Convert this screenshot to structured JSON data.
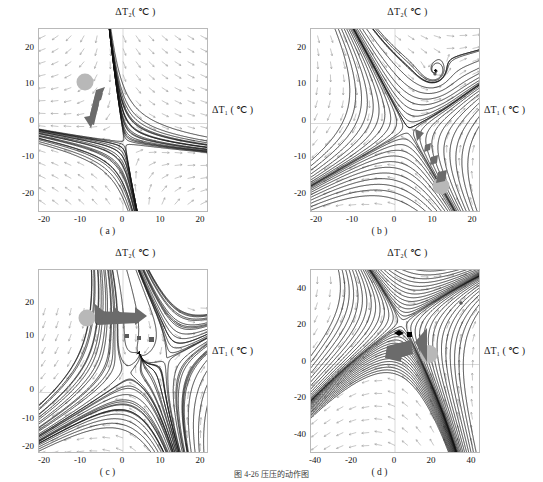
{
  "figure": {
    "caption": "图 4-26  压压的动作图",
    "axis_title_y": "ΔT₂( ℃ )",
    "axis_title_x": "ΔT₁ ( ℃ )"
  },
  "panels": [
    {
      "id": "a",
      "label": "( a )",
      "xticks": [
        "-20",
        "-10",
        "0",
        "10",
        "20"
      ],
      "yticks": [
        "20",
        "10",
        "0",
        "-10",
        "-20"
      ],
      "xlim": [
        -24,
        24
      ],
      "ylim": [
        -24,
        24
      ]
    },
    {
      "id": "b",
      "label": "( b )",
      "xticks": [
        "-20",
        "-10",
        "0",
        "10",
        "20"
      ],
      "yticks": [
        "20",
        "10",
        "0",
        "-10",
        "-20"
      ],
      "xlim": [
        -24,
        24
      ],
      "ylim": [
        -24,
        24
      ]
    },
    {
      "id": "c",
      "label": "( c )",
      "xticks": [
        "-20",
        "-10",
        "0",
        "10",
        "20"
      ],
      "yticks": [
        "20",
        "10",
        "0",
        "-10",
        "-20"
      ],
      "xlim": [
        -24,
        24
      ],
      "ylim": [
        -24,
        24
      ]
    },
    {
      "id": "d",
      "label": "( d )",
      "xticks": [
        "-40",
        "-20",
        "0",
        "20",
        "40"
      ],
      "yticks": [
        "40",
        "20",
        "0",
        "-20",
        "-40"
      ],
      "xlim": [
        -48,
        48
      ],
      "ylim": [
        -48,
        48
      ]
    }
  ],
  "chart_data": {
    "type": "scatter",
    "xlabel": "ΔT₁ ( ℃ )",
    "ylabel": "ΔT₂( ℃ )",
    "grid": false,
    "legend": "none",
    "subplots": [
      {
        "panel": "a",
        "xlim": [
          -24,
          24
        ],
        "ylim": [
          -24,
          24
        ],
        "xticks": [
          -20,
          -10,
          0,
          10,
          20
        ],
        "yticks": [
          -20,
          -10,
          0,
          10,
          20
        ],
        "fixed_points": [
          {
            "x": 0.5,
            "y": -6.0,
            "type": "saddle"
          }
        ],
        "markers": [
          {
            "name": "start-blob",
            "x": -9.5,
            "y": 11.0,
            "color": "#b8b8b8",
            "shape": "circle",
            "r_px": 9
          },
          {
            "name": "trajectory-arrow",
            "from": [
              -6.0,
              9.0
            ],
            "to": [
              -2.5,
              -2.0
            ],
            "color": "#6b6b6b"
          }
        ]
      },
      {
        "panel": "b",
        "xlim": [
          -24,
          24
        ],
        "ylim": [
          -24,
          24
        ],
        "xticks": [
          -20,
          -10,
          0,
          10,
          20
        ],
        "yticks": [
          -20,
          -10,
          0,
          10,
          20
        ],
        "fixed_points": [
          {
            "x": 11.5,
            "y": 13.0,
            "type": "focus"
          },
          {
            "x": 4.0,
            "y": -2.0,
            "type": "saddle"
          }
        ],
        "markers": [
          {
            "name": "start-blob",
            "x": 13.0,
            "y": -16.5,
            "color": "#b8b8b8",
            "shape": "circle",
            "r_px": 9
          },
          {
            "name": "trajectory-arrow",
            "from": [
              13.0,
              -13.0
            ],
            "to": [
              9.0,
              -3.5
            ],
            "color": "#6b6b6b"
          }
        ]
      },
      {
        "panel": "c",
        "xlim": [
          -24,
          24
        ],
        "ylim": [
          -24,
          24
        ],
        "xticks": [
          -20,
          -10,
          0,
          10,
          20
        ],
        "yticks": [
          -20,
          -10,
          0,
          10,
          20
        ],
        "fixed_points": [
          {
            "x": 4.5,
            "y": 10.5,
            "type": "node"
          },
          {
            "x": 9.0,
            "y": 5.5,
            "type": "saddle"
          }
        ],
        "markers": [
          {
            "name": "start-blob",
            "x": -9.0,
            "y": 11.0,
            "color": "#b8b8b8",
            "shape": "circle",
            "r_px": 9
          },
          {
            "name": "trajectory-arrow",
            "from": [
              -6.0,
              10.5
            ],
            "to": [
              3.5,
              10.5
            ],
            "color": "#6b6b6b"
          }
        ]
      },
      {
        "panel": "d",
        "xlim": [
          -48,
          48
        ],
        "ylim": [
          -48,
          48
        ],
        "xticks": [
          -40,
          -20,
          0,
          20,
          40
        ],
        "yticks": [
          -40,
          -20,
          0,
          20,
          40
        ],
        "fixed_points": [
          {
            "x": 40.0,
            "y": 32.0,
            "type": "focus"
          },
          {
            "x": 4.0,
            "y": 20.0,
            "type": "saddle"
          }
        ],
        "markers": [
          {
            "name": "start-blob",
            "x": 25.0,
            "y": 6.0,
            "color": "#b8b8b8",
            "shape": "circle",
            "r_px": 9
          },
          {
            "name": "trajectory-arrow",
            "from": [
              18.0,
              10.0
            ],
            "to": [
              6.0,
              6.0
            ],
            "color": "#6b6b6b"
          }
        ]
      }
    ]
  }
}
